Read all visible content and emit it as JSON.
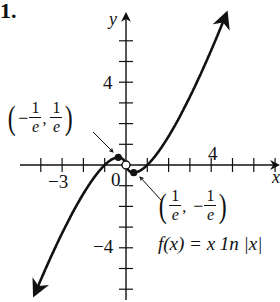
{
  "problem_number": "1.",
  "chart_data": {
    "type": "line",
    "title": "",
    "function_label": "f(x) = x 1n |x|",
    "xlabel": "x",
    "ylabel": "y",
    "xlim": [
      -5.5,
      7
    ],
    "ylim": [
      -7,
      7.5
    ],
    "tick_spacing": 1,
    "x_tick_labels": [
      {
        "value": -3,
        "label": "−3"
      },
      {
        "value": 0,
        "label": "0"
      },
      {
        "value": 4,
        "label": "4"
      }
    ],
    "y_tick_labels": [
      {
        "value": 4,
        "label": "4"
      },
      {
        "value": -4,
        "label": "−4"
      }
    ],
    "grid": false,
    "series": [
      {
        "name": "f(x) = x ln|x|",
        "x": [
          -4.2,
          -3,
          -2,
          -1,
          -0.368,
          -0.1,
          0.1,
          0.368,
          1,
          2,
          3,
          4,
          4.7
        ],
        "y": [
          -6.03,
          -3.3,
          -1.39,
          0,
          0.368,
          0.23,
          -0.23,
          -0.368,
          0,
          1.39,
          3.3,
          5.55,
          7.27
        ]
      }
    ],
    "annotations": [
      {
        "point": [
          -0.368,
          0.368
        ],
        "label": "(−1/e, 1/e)",
        "marker": "filled"
      },
      {
        "point": [
          0.368,
          -0.368
        ],
        "label": "(1/e, −1/e)",
        "marker": "filled"
      },
      {
        "point": [
          0,
          0
        ],
        "label": "",
        "marker": "open"
      }
    ],
    "legend_position": "none"
  },
  "labels": {
    "y_axis": "y",
    "x_axis": "x",
    "tick_neg3": "−3",
    "tick_0": "0",
    "tick_x4": "4",
    "tick_y4": "4",
    "tick_yneg4": "−4",
    "point1_num_a": "1",
    "point1_den_a": "e",
    "point1_num_b": "1",
    "point1_den_b": "e",
    "point1_minus": "−",
    "point2_num_a": "1",
    "point2_den_a": "e",
    "point2_num_b": "1",
    "point2_den_b": "e",
    "point2_minus": "−",
    "function_label": "f(x) = x 1n |x|"
  }
}
